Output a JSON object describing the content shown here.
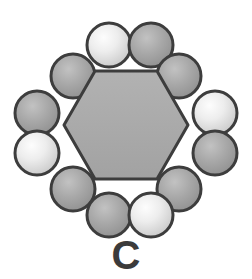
{
  "figure": {
    "label": "C",
    "label_name": "panel-label-c",
    "background_color": "#ffffff",
    "width": 252,
    "height": 279
  },
  "chart_data": {
    "type": "scatter",
    "title": "C",
    "subtitle": "",
    "xlabel": "",
    "ylabel": "",
    "grid": false,
    "legend": "none",
    "xlim": [
      0,
      252
    ],
    "ylim": [
      0,
      279
    ],
    "core": {
      "name": "central-hexagon",
      "shape": "hexagon",
      "orientation": "pointy-left-right",
      "center": [
        126,
        125
      ],
      "radius": 62,
      "fill": "#a9a9a9",
      "stroke": "#3d3d3d",
      "stroke_width": 3,
      "vertices": [
        [
          64,
          125
        ],
        [
          95,
          71
        ],
        [
          157,
          71
        ],
        [
          188,
          125
        ],
        [
          157,
          179
        ],
        [
          95,
          179
        ]
      ]
    },
    "shell_label": "shell-spheres",
    "sphere_radius": 22,
    "sphere_stroke": "#3d3d3d",
    "sphere_stroke_width": 3,
    "light_fill": "#ededed",
    "light_highlight": "#fdfdfd",
    "light_edge_tone": "#bdbdbd",
    "dark_fill": "#a3a3a3",
    "dark_highlight": "#c2c2c2",
    "dark_edge_tone": "#8e8e8e",
    "categories": [
      "top-left",
      "top-right",
      "upper-left-diagonal",
      "upper-right-diagonal",
      "left-upper",
      "right-upper",
      "left-lower",
      "right-lower",
      "lower-left-diagonal",
      "lower-right-diagonal",
      "bottom-left",
      "bottom-right"
    ],
    "series": [
      {
        "name": "shell spheres",
        "points": [
          {
            "id": "s1",
            "label": "top-left",
            "x": 109,
            "y": 45,
            "shade": "light",
            "r": 22
          },
          {
            "id": "s2",
            "label": "top-right",
            "x": 151,
            "y": 45,
            "shade": "dark",
            "r": 22
          },
          {
            "id": "s3",
            "label": "upper-left-diagonal",
            "x": 73,
            "y": 76,
            "shade": "dark",
            "r": 22
          },
          {
            "id": "s4",
            "label": "upper-right-diagonal",
            "x": 179,
            "y": 76,
            "shade": "dark",
            "r": 22
          },
          {
            "id": "s5",
            "label": "left-upper",
            "x": 37,
            "y": 113,
            "shade": "dark",
            "r": 22
          },
          {
            "id": "s6",
            "label": "right-upper",
            "x": 215,
            "y": 113,
            "shade": "light",
            "r": 22
          },
          {
            "id": "s7",
            "label": "left-lower",
            "x": 37,
            "y": 153,
            "shade": "light",
            "r": 22
          },
          {
            "id": "s8",
            "label": "right-lower",
            "x": 215,
            "y": 153,
            "shade": "dark",
            "r": 22
          },
          {
            "id": "s9",
            "label": "lower-left-diagonal",
            "x": 73,
            "y": 189,
            "shade": "dark",
            "r": 22
          },
          {
            "id": "s10",
            "label": "lower-right-diagonal",
            "x": 179,
            "y": 189,
            "shade": "dark",
            "r": 22
          },
          {
            "id": "s11",
            "label": "bottom-left",
            "x": 109,
            "y": 215,
            "shade": "dark",
            "r": 22
          },
          {
            "id": "s12",
            "label": "bottom-right",
            "x": 151,
            "y": 215,
            "shade": "light",
            "r": 22
          }
        ]
      }
    ],
    "counts": {
      "total_spheres": 12,
      "light_spheres": 4,
      "dark_spheres": 8,
      "core_shapes": 1
    }
  }
}
